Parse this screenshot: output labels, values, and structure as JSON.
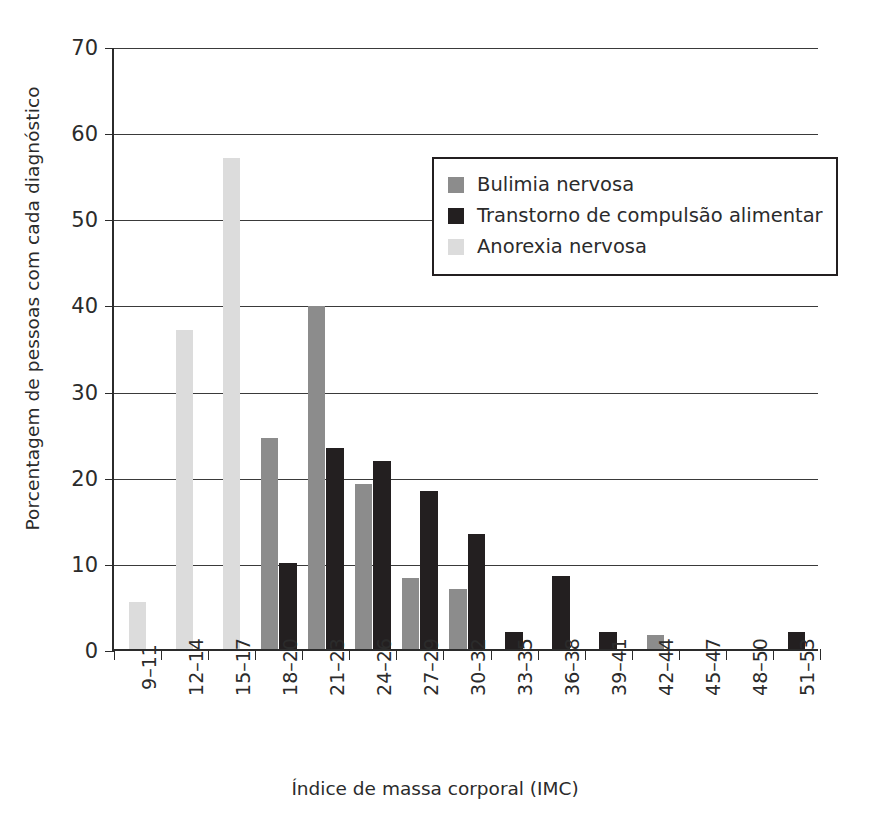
{
  "chart_data": {
    "type": "bar",
    "title": "",
    "xlabel": "Índice de massa corporal (IMC)",
    "ylabel": "Porcentagem de pessoas com cada diagnóstico",
    "ylim": [
      0,
      70
    ],
    "yticks": [
      0,
      10,
      20,
      30,
      40,
      50,
      60,
      70
    ],
    "grid": true,
    "legend_position": "upper-center-right",
    "categories": [
      "9–11",
      "12–14",
      "15–17",
      "18–20",
      "21–23",
      "24–26",
      "27–29",
      "30–32",
      "33–35",
      "36–38",
      "39–41",
      "42–44",
      "45–47",
      "48–50",
      "51–53"
    ],
    "series": [
      {
        "name": "Bulimia nervosa",
        "color": "#8c8c8c",
        "values": [
          0,
          0,
          0,
          24.5,
          39.8,
          19.2,
          8.3,
          7.0,
          0,
          0,
          0,
          1.6,
          0,
          0,
          0
        ]
      },
      {
        "name": "Transtorno de compulsão alimentar",
        "color": "#231f20",
        "values": [
          0,
          0,
          0,
          10.0,
          23.3,
          21.8,
          18.4,
          13.4,
          2.0,
          8.5,
          2.0,
          0,
          0,
          0,
          2.0
        ]
      },
      {
        "name": "Anorexia nervosa",
        "color": "#dcdcdc",
        "values": [
          5.5,
          37.0,
          57.0,
          0,
          0,
          0,
          0,
          0,
          0,
          0,
          0,
          0,
          0,
          0,
          0
        ]
      }
    ]
  },
  "legend": {
    "items": [
      {
        "label": "Bulimia nervosa",
        "color": "#8c8c8c"
      },
      {
        "label": "Transtorno de compulsão alimentar",
        "color": "#231f20"
      },
      {
        "label": "Anorexia nervosa",
        "color": "#dcdcdc"
      }
    ]
  },
  "axes": {
    "x_title": "Índice de massa corporal (IMC)",
    "y_title": "Porcentagem de pessoas com cada diagnóstico"
  },
  "colors": {
    "axis": "#2b2b2b",
    "grid": "#3a3a3a",
    "background": "#ffffff"
  }
}
